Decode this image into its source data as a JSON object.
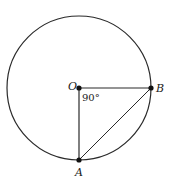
{
  "diagram": {
    "type": "circle-geometry",
    "colors": {
      "stroke": "#2a2a2a",
      "background": "#ffffff"
    },
    "circle": {
      "center": "O",
      "cx": 79,
      "cy": 88,
      "r": 72
    },
    "points": [
      {
        "id": "O",
        "label": "O",
        "x": 79,
        "y": 88
      },
      {
        "id": "B",
        "label": "B",
        "x": 151,
        "y": 88
      },
      {
        "id": "A",
        "label": "A",
        "x": 79,
        "y": 160
      }
    ],
    "segments": [
      {
        "from": "O",
        "to": "B"
      },
      {
        "from": "O",
        "to": "A"
      },
      {
        "from": "A",
        "to": "B"
      }
    ],
    "angle": {
      "vertex": "O",
      "label": "90°"
    }
  }
}
